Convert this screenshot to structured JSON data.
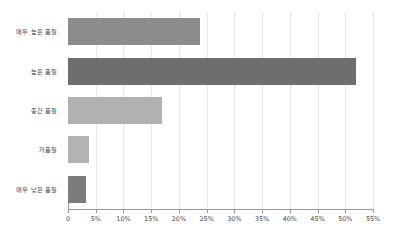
{
  "chart_data": {
    "type": "bar",
    "orientation": "horizontal",
    "title": "",
    "subtitle": "",
    "xlabel": "",
    "ylabel": "",
    "categories": [
      "매우 높은 품질",
      "높은 품질",
      "중간 품질",
      "저품질",
      "매우 낮은 품질"
    ],
    "values": [
      23.8,
      51.9,
      16.9,
      3.7,
      3.2
    ],
    "value_format": "percent",
    "xlim": [
      0,
      55
    ],
    "xticks": [
      0,
      5,
      10,
      15,
      20,
      25,
      30,
      35,
      40,
      45,
      50,
      55
    ],
    "xtick_labels": [
      "0",
      "5%",
      "10%",
      "15%",
      "20%",
      "25%",
      "30%",
      "35%",
      "40%",
      "45%",
      "50%",
      "55%"
    ],
    "grid": true,
    "grid_axis": "x",
    "legend": false,
    "bar_colors": [
      "#8c8c8c",
      "#6e6e6e",
      "#b1b1b1",
      "#b4b4b4",
      "#7b7b7b"
    ],
    "colors": {
      "background": "#ffffff",
      "gridline": "#e8e8e8",
      "axis": "#9a9a9a",
      "text": "#4a4a4a"
    }
  }
}
